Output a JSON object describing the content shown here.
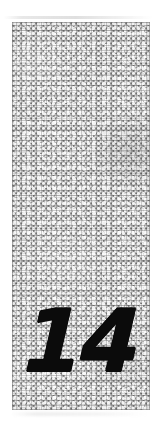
{
  "page": {
    "background_color": "#ffffff",
    "width": 157,
    "height": 426
  },
  "panel": {
    "label": "chapter-number-plate",
    "texture_name": "pebble-gravel-texture",
    "fill_colors": {
      "pebble_light": "#f2f2f2",
      "pebble_mid": "#d8d8d8",
      "mesh_dark": "#8a8a8a",
      "grout": "#555555"
    },
    "geometry": {
      "left": 12,
      "top": 22,
      "width": 138,
      "height": 388
    }
  },
  "chapter": {
    "number": "14",
    "color": "#0b0b0b",
    "style": "bold-italic"
  },
  "artifacts": {
    "top_smudge_name": "scan-smudge-top",
    "bottom_smudge_name": "scan-smudge-bottom"
  }
}
